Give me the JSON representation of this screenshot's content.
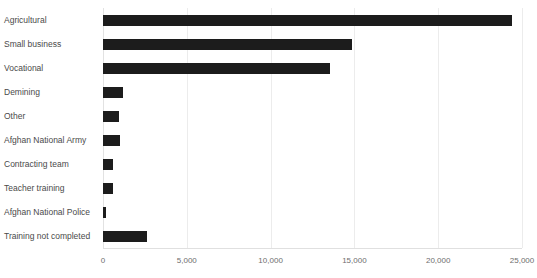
{
  "chart_data": {
    "type": "bar",
    "orientation": "horizontal",
    "title": "",
    "subtitle": "",
    "xlabel": "",
    "ylabel": "",
    "categories": [
      "Agricultural",
      "Small business",
      "Vocational",
      "Demining",
      "Other",
      "Afghan National Army",
      "Contracting team",
      "Teacher training",
      "Afghan National Police",
      "Training not completed"
    ],
    "values": [
      24400,
      14850,
      13550,
      1200,
      950,
      1000,
      600,
      600,
      150,
      2600
    ],
    "series": [
      {
        "name": "Count",
        "values": [
          24400,
          14850,
          13550,
          1200,
          950,
          1000,
          600,
          600,
          150,
          2600
        ]
      }
    ],
    "xlim": [
      0,
      25000
    ],
    "xticks": [
      0,
      5000,
      10000,
      15000,
      20000,
      25000
    ],
    "xtick_labels": [
      "0",
      "5,000",
      "10,000",
      "15,000",
      "20,000",
      "25,000"
    ],
    "grid": true,
    "grid_axis": "x",
    "legend": false,
    "legend_position": "none",
    "bar_color": "#1c1c1c",
    "gridline_color": "#ececec",
    "axis_label_color": "#6e6e6e",
    "category_label_color": "#4a4a4a",
    "background_color": "#ffffff"
  }
}
